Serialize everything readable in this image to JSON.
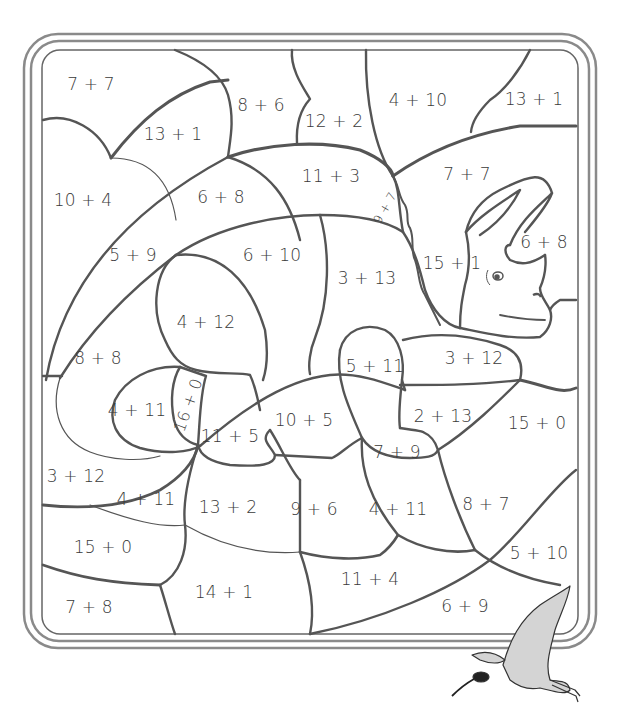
{
  "colors": {
    "line": "#555555",
    "frame": "#777777",
    "bird_fill": "#d0d0d0",
    "text": "#3a3a3a"
  },
  "regions": [
    {
      "id": "r1",
      "label": "7 + 7",
      "x": 91,
      "y": 84
    },
    {
      "id": "r2",
      "label": "13 + 1",
      "x": 173,
      "y": 134
    },
    {
      "id": "r3",
      "label": "8 + 6",
      "x": 261,
      "y": 105
    },
    {
      "id": "r4",
      "label": "12 + 2",
      "x": 334,
      "y": 121
    },
    {
      "id": "r5",
      "label": "4 + 10",
      "x": 418,
      "y": 100
    },
    {
      "id": "r6",
      "label": "13 + 1",
      "x": 534,
      "y": 99
    },
    {
      "id": "r7",
      "label": "10 + 4",
      "x": 83,
      "y": 200
    },
    {
      "id": "r8",
      "label": "6 + 8",
      "x": 221,
      "y": 197
    },
    {
      "id": "r9",
      "label": "11 + 3",
      "x": 331,
      "y": 176
    },
    {
      "id": "r10",
      "label": "9 + 7",
      "x": 385,
      "y": 208,
      "rotate": -60,
      "small": true
    },
    {
      "id": "r11",
      "label": "7 + 7",
      "x": 467,
      "y": 174
    },
    {
      "id": "r12",
      "label": "5 + 9",
      "x": 133,
      "y": 255
    },
    {
      "id": "r13",
      "label": "6 + 10",
      "x": 272,
      "y": 255
    },
    {
      "id": "r14",
      "label": "6 + 8",
      "x": 544,
      "y": 242
    },
    {
      "id": "r15",
      "label": "15 + 1",
      "x": 452,
      "y": 263
    },
    {
      "id": "r16",
      "label": "3 + 13",
      "x": 367,
      "y": 278
    },
    {
      "id": "r17",
      "label": "4 + 12",
      "x": 206,
      "y": 322
    },
    {
      "id": "r18",
      "label": "8 + 8",
      "x": 98,
      "y": 358
    },
    {
      "id": "r19",
      "label": "5 + 11",
      "x": 375,
      "y": 366
    },
    {
      "id": "r20",
      "label": "3 + 12",
      "x": 474,
      "y": 358
    },
    {
      "id": "r21",
      "label": "4 + 11",
      "x": 137,
      "y": 410
    },
    {
      "id": "r22",
      "label": "16 + 0",
      "x": 188,
      "y": 405,
      "rotate": -70
    },
    {
      "id": "r23",
      "label": "11 + 5",
      "x": 230,
      "y": 436
    },
    {
      "id": "r24",
      "label": "10 + 5",
      "x": 304,
      "y": 420
    },
    {
      "id": "r25",
      "label": "2 + 13",
      "x": 443,
      "y": 416
    },
    {
      "id": "r26",
      "label": "15 + 0",
      "x": 537,
      "y": 423
    },
    {
      "id": "r27",
      "label": "7 + 9",
      "x": 397,
      "y": 452
    },
    {
      "id": "r28",
      "label": "3 + 12",
      "x": 76,
      "y": 476
    },
    {
      "id": "r29",
      "label": "4 + 11",
      "x": 146,
      "y": 499
    },
    {
      "id": "r30",
      "label": "13 + 2",
      "x": 228,
      "y": 507
    },
    {
      "id": "r31",
      "label": "9 + 6",
      "x": 314,
      "y": 509
    },
    {
      "id": "r32",
      "label": "4 + 11",
      "x": 398,
      "y": 509
    },
    {
      "id": "r33",
      "label": "8 + 7",
      "x": 486,
      "y": 504
    },
    {
      "id": "r34",
      "label": "15 + 0",
      "x": 103,
      "y": 547
    },
    {
      "id": "r35",
      "label": "5 + 10",
      "x": 539,
      "y": 553
    },
    {
      "id": "r36",
      "label": "11 + 4",
      "x": 370,
      "y": 579
    },
    {
      "id": "r37",
      "label": "14 + 1",
      "x": 224,
      "y": 592
    },
    {
      "id": "r38",
      "label": "7 + 8",
      "x": 89,
      "y": 607
    },
    {
      "id": "r39",
      "label": "6 + 9",
      "x": 465,
      "y": 606
    }
  ]
}
